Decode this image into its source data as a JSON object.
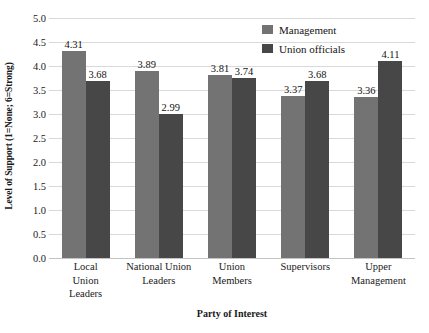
{
  "chart_data": {
    "type": "bar",
    "title": "",
    "xlabel": "Party of Interest",
    "ylabel": "Level of Support (1=None; 6=Strong)",
    "categories": [
      "Local Union Leaders",
      "National Union Leaders",
      "Union Members",
      "Supervisors",
      "Upper Management"
    ],
    "category_lines": [
      [
        "Local",
        "Union",
        "Leaders"
      ],
      [
        "National Union",
        "Leaders"
      ],
      [
        "Union",
        "Members"
      ],
      [
        "Supervisors"
      ],
      [
        "Upper",
        "Management"
      ]
    ],
    "series": [
      {
        "name": "Management",
        "color": "#737373",
        "values": [
          4.31,
          3.89,
          3.81,
          3.37,
          3.36
        ],
        "labels": [
          "4.31",
          "3.89",
          "3.81",
          "3.37",
          "3.36"
        ]
      },
      {
        "name": "Union officials",
        "color": "#474747",
        "values": [
          3.68,
          2.99,
          3.74,
          3.68,
          4.11
        ],
        "labels": [
          "3.68",
          "2.99",
          "3.74",
          "3.68",
          "4.11"
        ]
      }
    ],
    "ylim": [
      0.0,
      5.0
    ],
    "ytick_labels": [
      "5.0",
      "4.5",
      "4.0",
      "3.5",
      "3.0",
      "2.5",
      "2.0",
      "1.5",
      "1.0",
      "0.5",
      "0.0"
    ],
    "ytick_values": [
      5.0,
      4.5,
      4.0,
      3.5,
      3.0,
      2.5,
      2.0,
      1.5,
      1.0,
      0.5,
      0.0
    ],
    "grid": true,
    "legend_position": "top-right",
    "legend": [
      "Management",
      "Union officials"
    ],
    "background_color": "#ffffff",
    "gridline_color": "#d9d9d9"
  }
}
